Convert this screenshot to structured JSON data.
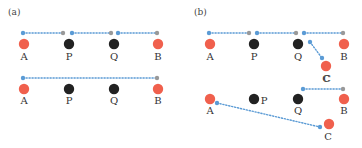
{
  "colors": {
    "red": "#f0604d",
    "black": "#222222",
    "blue": "#5b9bd5",
    "gray": "#999999",
    "label": "#333333"
  },
  "panels": [
    {
      "id": "a",
      "label": "(a)",
      "rows": [
        {
          "nodes": [
            {
              "name": "A",
              "x": 24,
              "y": 44,
              "color": "red",
              "label_x": 24,
              "label_y": 60
            },
            {
              "name": "P",
              "x": 69,
              "y": 44,
              "color": "black",
              "label_x": 69,
              "label_y": 60
            },
            {
              "name": "Q",
              "x": 114,
              "y": 44,
              "color": "black",
              "label_x": 114,
              "label_y": 60
            },
            {
              "name": "B",
              "x": 158,
              "y": 44,
              "color": "red",
              "label_x": 158,
              "label_y": 60
            }
          ],
          "segments": [
            {
              "x1": 23,
              "y1": 33,
              "x2": 63,
              "y2": 33,
              "start": "blue",
              "end": "gray"
            },
            {
              "x1": 72,
              "y1": 33,
              "x2": 111,
              "y2": 33,
              "start": "blue",
              "end": "gray"
            },
            {
              "x1": 118,
              "y1": 33,
              "x2": 157,
              "y2": 33,
              "start": "blue",
              "end": "gray"
            }
          ]
        },
        {
          "nodes": [
            {
              "name": "A",
              "x": 24,
              "y": 89,
              "color": "red",
              "label_x": 24,
              "label_y": 104
            },
            {
              "name": "P",
              "x": 69,
              "y": 89,
              "color": "black",
              "label_x": 69,
              "label_y": 104
            },
            {
              "name": "Q",
              "x": 114,
              "y": 89,
              "color": "black",
              "label_x": 114,
              "label_y": 104
            },
            {
              "name": "B",
              "x": 158,
              "y": 89,
              "color": "red",
              "label_x": 158,
              "label_y": 104
            }
          ],
          "segments": [
            {
              "x1": 23,
              "y1": 78,
              "x2": 157,
              "y2": 78,
              "start": "blue",
              "end": "gray"
            }
          ]
        }
      ]
    },
    {
      "id": "b",
      "label": "(b)",
      "rows": [
        {
          "nodes": [
            {
              "name": "A",
              "x": 210,
              "y": 44,
              "color": "red",
              "label_x": 210,
              "label_y": 60
            },
            {
              "name": "P",
              "x": 254,
              "y": 44,
              "color": "black",
              "label_x": 254,
              "label_y": 60
            },
            {
              "name": "Q",
              "x": 298,
              "y": 44,
              "color": "black",
              "label_x": 298,
              "label_y": 60
            },
            {
              "name": "B",
              "x": 344,
              "y": 44,
              "color": "red",
              "label_x": 344,
              "label_y": 60
            },
            {
              "name": "C",
              "x": 326,
              "y": 66,
              "color": "red",
              "label_x": 326,
              "label_y": 82
            }
          ],
          "segments": [
            {
              "x1": 209,
              "y1": 33,
              "x2": 249,
              "y2": 33,
              "start": "blue",
              "end": "gray"
            },
            {
              "x1": 257,
              "y1": 33,
              "x2": 296,
              "y2": 33,
              "start": "blue",
              "end": "gray"
            },
            {
              "x1": 304,
              "y1": 33,
              "x2": 343,
              "y2": 33,
              "start": "blue",
              "end": "gray"
            },
            {
              "x1": 310,
              "y1": 42,
              "x2": 322,
              "y2": 58,
              "start": "blue",
              "end": "blue"
            }
          ]
        },
        {
          "nodes": [
            {
              "name": "A",
              "x": 210,
              "y": 99,
              "color": "red",
              "label_x": 210,
              "label_y": 114
            },
            {
              "name": "P",
              "x": 254,
              "y": 99,
              "color": "black",
              "label_x": 264,
              "label_y": 104
            },
            {
              "name": "Q",
              "x": 298,
              "y": 99,
              "color": "black",
              "label_x": 298,
              "label_y": 114
            },
            {
              "name": "B",
              "x": 344,
              "y": 99,
              "color": "red",
              "label_x": 344,
              "label_y": 114
            },
            {
              "name": "C",
              "x": 329,
              "y": 124,
              "color": "red",
              "label_x": 328,
              "label_y": 140
            },
            {
              "name": "C_top",
              "display": "C",
              "x": null,
              "y": null,
              "color": null,
              "label_x": 327,
              "label_y": 82
            }
          ],
          "segments": [
            {
              "x1": 303,
              "y1": 89,
              "x2": 343,
              "y2": 89,
              "start": "blue",
              "end": "gray"
            },
            {
              "x1": 217,
              "y1": 103,
              "x2": 320,
              "y2": 127,
              "start": "blue",
              "end": "blue"
            }
          ]
        }
      ]
    }
  ]
}
